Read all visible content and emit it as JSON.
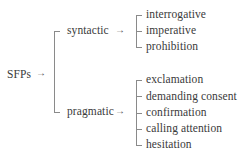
{
  "diagram": {
    "type": "classification-tree",
    "root": {
      "label": "SFPs",
      "arrow": "→"
    },
    "branches": [
      {
        "label": "syntactic",
        "arrow": "→",
        "children": [
          "interrogative",
          "imperative",
          "prohibition"
        ]
      },
      {
        "label": "pragmatic",
        "arrow": "→",
        "children": [
          "exclamation",
          "demanding consent",
          "confirmation",
          "calling attention",
          "hesitation"
        ]
      }
    ],
    "line_color": "#8a8a8a",
    "text_color": "#3a3a3a"
  }
}
